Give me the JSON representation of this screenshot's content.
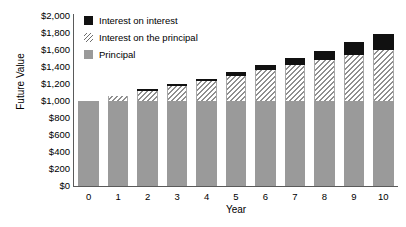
{
  "chart_data": {
    "type": "bar",
    "stacked": true,
    "title": "",
    "xlabel": "Year",
    "ylabel": "Future Value",
    "categories": [
      "0",
      "1",
      "2",
      "3",
      "4",
      "5",
      "6",
      "7",
      "8",
      "9",
      "10"
    ],
    "x": [
      0,
      1,
      2,
      3,
      4,
      5,
      6,
      7,
      8,
      9,
      10
    ],
    "series": [
      {
        "name": "Principal",
        "swatch": "solid-gray",
        "color": "#9a9a9a",
        "values": [
          1000,
          1000,
          1000,
          1000,
          1000,
          1000,
          1000,
          1000,
          1000,
          1000,
          1000
        ]
      },
      {
        "name": "Interest on the principal",
        "swatch": "diagonal-hatch",
        "color": "#8f8f8f",
        "values": [
          0,
          60,
          120,
          180,
          240,
          300,
          360,
          420,
          480,
          540,
          600
        ]
      },
      {
        "name": "Interest on interest",
        "swatch": "solid-black",
        "color": "#111111",
        "values": [
          0,
          0,
          4,
          11,
          22,
          38,
          58,
          84,
          114,
          151,
          191
        ]
      }
    ],
    "totals": [
      1000,
      1060,
      1124,
      1191,
      1262,
      1338,
      1418,
      1504,
      1594,
      1691,
      1791
    ],
    "ylim": [
      0,
      2000
    ],
    "yticks": [
      0,
      200,
      400,
      600,
      800,
      1000,
      1200,
      1400,
      1600,
      1800,
      2000
    ],
    "ytick_labels": [
      "$0",
      "$200",
      "$400",
      "$600",
      "$800",
      "$1,000",
      "$1,200",
      "$1,400",
      "$1,600",
      "$1,800",
      "$2,000"
    ],
    "grid": false,
    "legend_position": "top-left",
    "legend": [
      {
        "label": "Interest on interest",
        "swatch": "solid-black"
      },
      {
        "label": "Interest on the principal",
        "swatch": "diagonal-hatch"
      },
      {
        "label": "Principal",
        "swatch": "solid-gray"
      }
    ]
  }
}
